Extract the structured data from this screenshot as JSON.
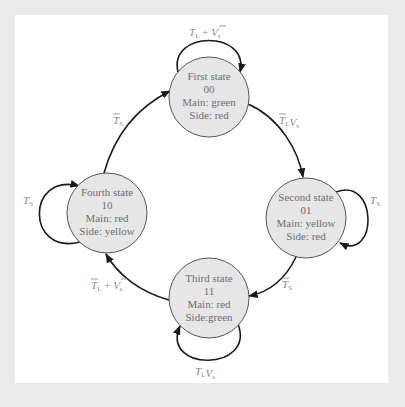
{
  "diagram": {
    "title": "",
    "colors": {
      "outer_background": "#ebebeb",
      "panel_background": "#ffffff",
      "node_fill": "#e6e6e6",
      "node_stroke": "#555555",
      "edge_stroke": "#1a1a1a",
      "node_text": "#6e6e6e",
      "label_text": "#8a8a8a"
    },
    "nodes": [
      {
        "id": "first",
        "lines": [
          "First state",
          "00",
          "Main: green",
          "Side: red"
        ],
        "cx": 209,
        "cy": 97,
        "r": 40
      },
      {
        "id": "second",
        "lines": [
          "Second state",
          "01",
          "Main: yellow",
          "Side: red"
        ],
        "cx": 306,
        "cy": 218,
        "r": 40
      },
      {
        "id": "third",
        "lines": [
          "Third state",
          "11",
          "Main: red",
          "Side:green"
        ],
        "cx": 209,
        "cy": 298,
        "r": 40
      },
      {
        "id": "fourth",
        "lines": [
          "Fourth state",
          "10",
          "Main: red",
          "Side: yellow"
        ],
        "cx": 107,
        "cy": 213,
        "r": 40
      }
    ],
    "edges": [
      {
        "from": "first",
        "to": "first",
        "label": {
          "base1": "T",
          "sub1": "L",
          "op": " + ",
          "base2": "V",
          "sub2": "s",
          "bar1": false,
          "bar2": true
        }
      },
      {
        "from": "first",
        "to": "second",
        "label": {
          "base1": "T",
          "sub1": "L",
          "op": "",
          "base2": "V",
          "sub2": "s",
          "bar1": true,
          "bar2": false
        }
      },
      {
        "from": "second",
        "to": "second",
        "label": {
          "base1": "T",
          "sub1": "S",
          "bar1": false
        }
      },
      {
        "from": "second",
        "to": "third",
        "label": {
          "base1": "T",
          "sub1": "S",
          "bar1": true
        }
      },
      {
        "from": "third",
        "to": "third",
        "label": {
          "base1": "T",
          "sub1": "L",
          "op": "",
          "base2": "V",
          "sub2": "s",
          "bar1": false,
          "bar2": false
        }
      },
      {
        "from": "third",
        "to": "fourth",
        "label": {
          "base1": "T",
          "sub1": "L",
          "op": " + ",
          "base2": "V",
          "sub2": "s",
          "bar1": true,
          "bar2": true
        }
      },
      {
        "from": "fourth",
        "to": "fourth",
        "label": {
          "base1": "T",
          "sub1": "S",
          "bar1": false
        }
      },
      {
        "from": "fourth",
        "to": "first",
        "label": {
          "base1": "T",
          "sub1": "S",
          "bar1": true
        }
      }
    ]
  }
}
